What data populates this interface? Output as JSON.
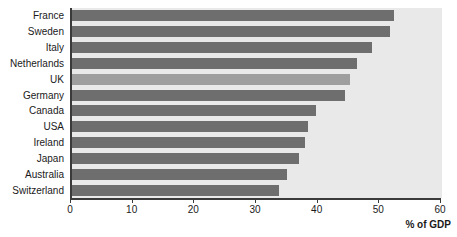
{
  "chart_data": {
    "type": "bar",
    "orientation": "horizontal",
    "title": "",
    "xlabel": "% of GDP",
    "ylabel": "",
    "xlim": [
      0,
      60
    ],
    "xticks": [
      0,
      10,
      20,
      30,
      40,
      50,
      60
    ],
    "grid": false,
    "legend": null,
    "categories": [
      "France",
      "Sweden",
      "Italy",
      "Netherlands",
      "UK",
      "Germany",
      "Canada",
      "USA",
      "Ireland",
      "Japan",
      "Australia",
      "Switzerland"
    ],
    "values": [
      52.2,
      51.6,
      48.6,
      46.2,
      45.1,
      44.2,
      39.5,
      38.2,
      37.8,
      36.8,
      34.8,
      33.5
    ],
    "highlight_category": "UK",
    "colors": {
      "bar": "#6e6e6e",
      "bar_highlight": "#9e9e9e",
      "plot_background": "#e9e9e9",
      "axis": "#3a3a3a",
      "text": "#1a1a1a",
      "page_background": "#ffffff"
    }
  }
}
